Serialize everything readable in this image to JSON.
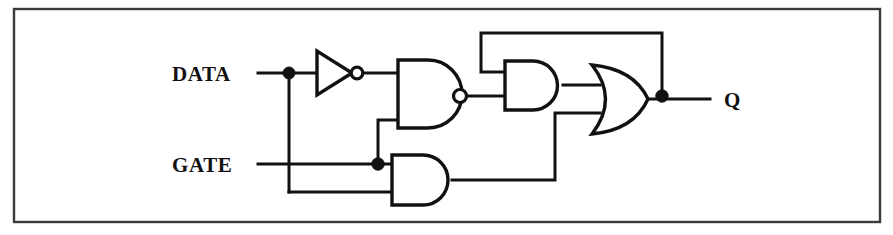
{
  "diagram": {
    "type": "logic-circuit-schematic",
    "background_color": "#ffffff",
    "line_color": "#111111",
    "frame_color": "#3a3a3a"
  },
  "labels": {
    "input_data": "DATA",
    "input_gate": "GATE",
    "output_q": "Q"
  },
  "gates": [
    {
      "id": "inverter",
      "kind": "NOT",
      "name": "not-gate-data"
    },
    {
      "id": "nand1",
      "kind": "NAND",
      "name": "nand-gate-1"
    },
    {
      "id": "and2",
      "kind": "AND",
      "name": "and-gate-2"
    },
    {
      "id": "and3",
      "kind": "AND",
      "name": "and-gate-3"
    },
    {
      "id": "or1",
      "kind": "OR",
      "name": "or-gate-1"
    }
  ],
  "junctions": [
    {
      "id": "data-tap",
      "name": "junction-data"
    },
    {
      "id": "gate-tap",
      "name": "junction-gate"
    },
    {
      "id": "q-tap",
      "name": "junction-q-feedback"
    }
  ]
}
